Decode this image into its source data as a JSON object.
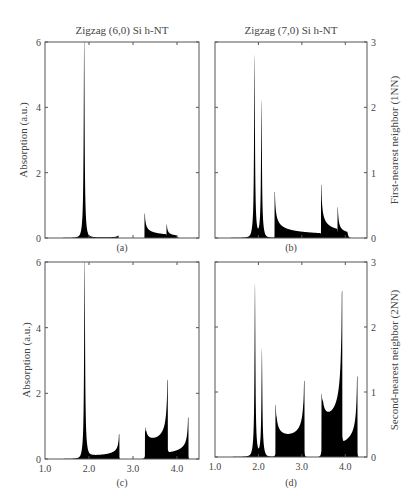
{
  "chart_data": [
    {
      "id": "a",
      "type": "area",
      "title": "Zigzag (6,0) Si h-NT",
      "caption": "(a)",
      "xlabel": "",
      "ylabel": "Absorption (a.u.)",
      "xlim": [
        1.0,
        4.5
      ],
      "ylim": [
        0,
        6
      ],
      "yticks": [
        "0",
        "2",
        "4",
        "6"
      ],
      "xticks": [],
      "grid": false,
      "peaks": [
        {
          "x": 1.89,
          "y": 6.0,
          "kind": "spike"
        },
        {
          "x": 2.66,
          "y": 0.12,
          "kind": "edge"
        },
        {
          "x": 3.27,
          "y": 0.75,
          "kind": "vhs"
        },
        {
          "x": 3.77,
          "y": 0.36,
          "kind": "vhs"
        }
      ]
    },
    {
      "id": "b",
      "type": "area",
      "title": "Zigzag (7,0) Si h-NT",
      "caption": "(b)",
      "xlabel": "",
      "ylabel_right": "First-nearest neighbor (1NN)",
      "xlim": [
        1.0,
        4.5
      ],
      "ylim": [
        0,
        3
      ],
      "yticks": [
        "0",
        "1",
        "2",
        "3"
      ],
      "xticks": [],
      "grid": false,
      "peaks": [
        {
          "x": 1.91,
          "y": 2.68,
          "kind": "spike"
        },
        {
          "x": 2.07,
          "y": 1.99,
          "kind": "spike"
        },
        {
          "x": 2.38,
          "y": 0.7,
          "kind": "vhs"
        },
        {
          "x": 3.45,
          "y": 0.78,
          "kind": "vhs"
        },
        {
          "x": 3.83,
          "y": 0.41,
          "kind": "vhs"
        }
      ]
    },
    {
      "id": "c",
      "type": "area",
      "title": "",
      "caption": "(c)",
      "xlabel": "",
      "ylabel": "Absorption (a.u.)",
      "xlim": [
        1.0,
        4.5
      ],
      "ylim": [
        0,
        6
      ],
      "yticks": [
        "0",
        "2",
        "4",
        "6"
      ],
      "xticks": [
        "1.0",
        "2.0",
        "3.0",
        "4.0"
      ],
      "grid": false,
      "peaks": [
        {
          "x": 1.9,
          "y": 6.0,
          "kind": "spike"
        },
        {
          "x": 2.68,
          "y": 0.75,
          "kind": "rise"
        },
        {
          "x": 3.28,
          "y": 0.85,
          "kind": "vhs"
        },
        {
          "x": 3.78,
          "y": 2.27,
          "kind": "rise"
        },
        {
          "x": 4.25,
          "y": 1.26,
          "kind": "rise"
        }
      ]
    },
    {
      "id": "d",
      "type": "area",
      "title": "",
      "caption": "(d)",
      "xlabel": "",
      "ylabel_right": "Second-nearest neighbor (2NN)",
      "xlim": [
        1.0,
        4.5
      ],
      "ylim": [
        0,
        3
      ],
      "yticks": [
        "0",
        "1",
        "2",
        "3"
      ],
      "xticks": [
        "1.0",
        "2.0",
        "3.0",
        "4.0"
      ],
      "grid": false,
      "peaks": [
        {
          "x": 1.92,
          "y": 2.56,
          "kind": "spike"
        },
        {
          "x": 2.08,
          "y": 1.54,
          "kind": "spike"
        },
        {
          "x": 2.4,
          "y": 0.75,
          "kind": "vhs"
        },
        {
          "x": 3.05,
          "y": 1.14,
          "kind": "rise"
        },
        {
          "x": 3.46,
          "y": 0.85,
          "kind": "vhs"
        },
        {
          "x": 3.92,
          "y": 2.4,
          "kind": "rise"
        },
        {
          "x": 4.27,
          "y": 1.24,
          "kind": "rise"
        }
      ]
    }
  ],
  "labels": {
    "title_a": "Zigzag (6,0) Si h-NT",
    "title_b": "Zigzag (7,0) Si h-NT",
    "ylabel_left_top": "Absorption (a.u.)",
    "ylabel_left_bottom": "Absorption (a.u.)",
    "ylabel_right_top": "First-nearest neighbor (1NN)",
    "ylabel_right_bottom": "Second-nearest neighbor (2NN)",
    "caption_a": "(a)",
    "caption_b": "(b)",
    "caption_c": "(c)",
    "caption_d": "(d)",
    "yticks_left": [
      "0",
      "2",
      "4",
      "6"
    ],
    "yticks_right": [
      "0",
      "1",
      "2",
      "3"
    ],
    "xticks": [
      "1.0",
      "2.0",
      "3.0",
      "4.0"
    ]
  }
}
